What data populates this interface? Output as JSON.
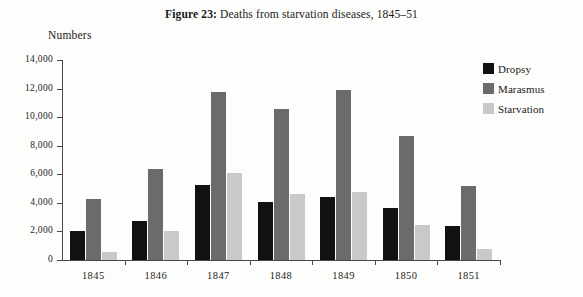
{
  "figure": {
    "label": "Figure 23:",
    "caption": "Deaths from starvation diseases, 1845–51"
  },
  "axis_title": "Numbers",
  "legend": {
    "items": [
      {
        "label": "Dropsy",
        "color": "#111111"
      },
      {
        "label": "Marasmus",
        "color": "#6b6b6b"
      },
      {
        "label": "Starvation",
        "color": "#c9c9c9"
      }
    ]
  },
  "chart_data": {
    "type": "bar",
    "title": "Figure 23: Deaths from starvation diseases, 1845–51",
    "xlabel": "",
    "ylabel": "Numbers",
    "ylim": [
      0,
      14000
    ],
    "yticks": [
      0,
      2000,
      4000,
      6000,
      8000,
      10000,
      12000,
      14000
    ],
    "ytick_labels": [
      "0",
      "2,000",
      "4,000",
      "6,000",
      "8,000",
      "10,000",
      "12,000",
      "14,000"
    ],
    "grid": false,
    "legend_position": "right",
    "categories": [
      "1845",
      "1846",
      "1847",
      "1848",
      "1849",
      "1850",
      "1851"
    ],
    "series": [
      {
        "name": "Dropsy",
        "color": "#111111",
        "values": [
          2000,
          2750,
          5250,
          4050,
          4400,
          3650,
          2400
        ]
      },
      {
        "name": "Marasmus",
        "color": "#6b6b6b",
        "values": [
          4300,
          6350,
          11750,
          10600,
          11900,
          8700,
          5200
        ]
      },
      {
        "name": "Starvation",
        "color": "#c9c9c9",
        "values": [
          550,
          2050,
          6100,
          4650,
          4750,
          2450,
          800
        ]
      }
    ]
  }
}
